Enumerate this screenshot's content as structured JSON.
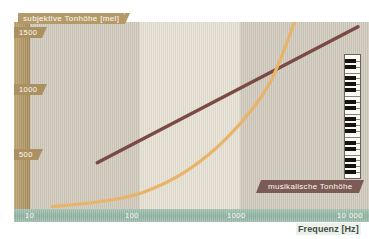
{
  "chart_data": {
    "type": "line",
    "title": "",
    "xlabel": "Frequenz [Hz]",
    "ylabel": "subjektive Tonhöhe [mel]",
    "xscale": "log",
    "xlim": [
      10,
      10000
    ],
    "ylim": [
      0,
      1600
    ],
    "xticks": [
      "10",
      "100",
      "1000",
      "10 000"
    ],
    "xtick_values": [
      10,
      100,
      1000,
      10000
    ],
    "yticks": [
      "500",
      "1000",
      "1500"
    ],
    "ytick_values": [
      500,
      1000,
      1500
    ],
    "grid": false,
    "legend_position": "inside-bottom-right",
    "series": [
      {
        "name": "subjektive Tonhöhe [mel]",
        "color": "#7a4a47",
        "note": "straight rising line on log-frequency axis (mel scale)",
        "points": [
          {
            "x": 40,
            "y": 395
          },
          {
            "x": 100,
            "y": 620
          },
          {
            "x": 300,
            "y": 900
          },
          {
            "x": 1000,
            "y": 1150
          },
          {
            "x": 3000,
            "y": 1380
          },
          {
            "x": 8000,
            "y": 1560
          }
        ]
      },
      {
        "name": "musikalische Tonhöhe",
        "color": "#e8b46a",
        "note": "exponential curve rising steeply; equals subjective pitch near 1300 Hz",
        "points": [
          {
            "x": 16,
            "y": 20
          },
          {
            "x": 40,
            "y": 60
          },
          {
            "x": 100,
            "y": 140
          },
          {
            "x": 250,
            "y": 330
          },
          {
            "x": 600,
            "y": 640
          },
          {
            "x": 1300,
            "y": 1060
          },
          {
            "x": 2200,
            "y": 1600
          }
        ]
      }
    ],
    "annotations": [
      {
        "label": "musikalische Tonhöhe",
        "color": "#7a5b55",
        "text_color": "#fdf8f0"
      },
      {
        "label": "Klaviatur",
        "icon": "piano-keyboard-icon"
      }
    ],
    "bands": [
      {
        "from": 10,
        "to": 100,
        "color": "#cfc8bb"
      },
      {
        "from": 100,
        "to": 1000,
        "color": "#e6e0d2"
      },
      {
        "from": 1000,
        "to": 10000,
        "color": "#cfc8bb"
      }
    ],
    "colors": {
      "y_axis_band": "#b49a68",
      "x_axis_band": "#8fb3a1",
      "subjective_line": "#7a4a47",
      "musical_curve": "#e8b46a",
      "legend_plate": "#7a5b55",
      "tick_text": "#fdfaf2",
      "x_title_text": "#3b4f48"
    }
  },
  "y_axis": {
    "title": "subjektive Tonhöhe [mel]",
    "ticks": [
      "1500",
      "1000",
      "500"
    ]
  },
  "x_axis": {
    "title": "Frequenz [Hz]",
    "ticks": [
      "10",
      "100",
      "1000",
      "10 000"
    ]
  },
  "legend": {
    "musical": "musikalische Tonhöhe"
  }
}
